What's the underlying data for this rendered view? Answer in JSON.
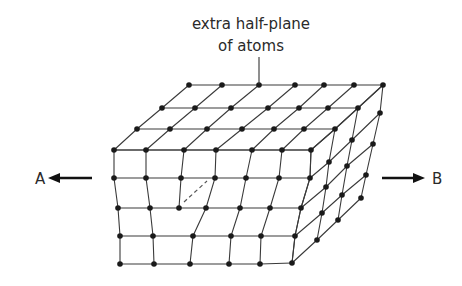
{
  "diagram": {
    "annotation": {
      "line1": "extra half-plane",
      "line2": "of atoms",
      "leader_from": [
        259,
        57
      ],
      "leader_to": [
        259,
        84
      ]
    },
    "arrows": {
      "left": {
        "label": "A",
        "from": [
          92,
          178
        ],
        "to": [
          48,
          178
        ],
        "label_pos": [
          35,
          184
        ]
      },
      "right": {
        "label": "B",
        "from": [
          382,
          178
        ],
        "to": [
          425,
          178
        ],
        "label_pos": [
          432,
          184
        ]
      }
    },
    "top_face_rows": [
      {
        "y": 85,
        "xs": [
          189,
          222,
          259,
          295,
          324,
          354,
          383
        ]
      },
      {
        "y": 108,
        "xs": [
          162,
          195,
          231,
          268,
          299,
          328,
          358
        ]
      },
      {
        "y": 129,
        "xs": [
          137,
          170,
          207,
          242,
          274,
          304,
          335
        ]
      },
      {
        "y": 150,
        "xs": [
          114,
          146,
          184,
          216,
          252,
          282,
          311
        ]
      }
    ],
    "front_face_columns": [
      [
        [
          114,
          150
        ],
        [
          114,
          178
        ],
        [
          118,
          208
        ],
        [
          120,
          236
        ],
        [
          120,
          264
        ]
      ],
      [
        [
          146,
          150
        ],
        [
          146,
          178
        ],
        [
          150,
          208
        ],
        [
          153,
          236
        ],
        [
          154,
          264
        ]
      ],
      [
        [
          184,
          150
        ],
        [
          181,
          178
        ],
        [
          179,
          208
        ]
      ],
      [
        [
          216,
          150
        ],
        [
          215,
          178
        ],
        [
          206,
          208
        ],
        [
          193,
          236
        ],
        [
          190,
          264
        ]
      ],
      [
        [
          252,
          150
        ],
        [
          246,
          178
        ],
        [
          240,
          208
        ],
        [
          231,
          236
        ],
        [
          229,
          264
        ]
      ],
      [
        [
          282,
          150
        ],
        [
          279,
          178
        ],
        [
          270,
          208
        ],
        [
          261,
          236
        ],
        [
          260,
          264
        ]
      ],
      [
        [
          311,
          150
        ],
        [
          310,
          178
        ],
        [
          301,
          208
        ],
        [
          295,
          236
        ],
        [
          292,
          263
        ]
      ]
    ],
    "front_face_rows": [
      [
        [
          114,
          150
        ],
        [
          146,
          150
        ],
        [
          184,
          150
        ],
        [
          216,
          150
        ],
        [
          252,
          150
        ],
        [
          282,
          150
        ],
        [
          311,
          150
        ]
      ],
      [
        [
          114,
          178
        ],
        [
          146,
          178
        ],
        [
          181,
          178
        ],
        [
          215,
          178
        ],
        [
          246,
          178
        ],
        [
          279,
          178
        ],
        [
          310,
          178
        ]
      ],
      [
        [
          118,
          208
        ],
        [
          150,
          208
        ],
        [
          179,
          208
        ],
        [
          206,
          208
        ],
        [
          240,
          208
        ],
        [
          270,
          208
        ],
        [
          301,
          208
        ]
      ],
      [
        [
          120,
          236
        ],
        [
          153,
          236
        ],
        [
          193,
          236
        ],
        [
          231,
          236
        ],
        [
          261,
          236
        ],
        [
          295,
          236
        ]
      ],
      [
        [
          120,
          264
        ],
        [
          154,
          264
        ],
        [
          190,
          264
        ],
        [
          229,
          264
        ],
        [
          260,
          264
        ],
        [
          292,
          263
        ]
      ]
    ],
    "right_face_columns": [
      [
        [
          383,
          85
        ],
        [
          380,
          113
        ],
        [
          373,
          144
        ],
        [
          366,
          175
        ],
        [
          361,
          198
        ]
      ],
      [
        [
          358,
          108
        ],
        [
          352,
          140
        ],
        [
          347,
          166
        ],
        [
          342,
          195
        ],
        [
          338,
          220
        ]
      ],
      [
        [
          335,
          129
        ],
        [
          329,
          162
        ],
        [
          326,
          187
        ],
        [
          322,
          213
        ],
        [
          317,
          240
        ]
      ],
      [
        [
          311,
          150
        ],
        [
          310,
          178
        ],
        [
          301,
          208
        ],
        [
          295,
          236
        ],
        [
          292,
          263
        ]
      ]
    ],
    "dashed_segment": {
      "from": [
        184,
        202
      ],
      "to": [
        207,
        181
      ]
    },
    "colors": {
      "line": "#3a3a3a",
      "atom": "#1a1a1a",
      "text": "#2a2a2a",
      "arrow": "#111111"
    }
  }
}
